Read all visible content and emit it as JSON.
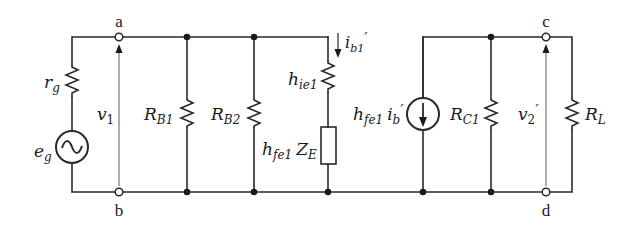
{
  "diagram": {
    "type": "small-signal equivalent circuit",
    "terminals": {
      "a": "a",
      "b": "b",
      "c": "c",
      "d": "d"
    },
    "source": {
      "resistor": {
        "sym": "r",
        "sub": "g"
      },
      "voltage": {
        "sym": "e",
        "sub": "g"
      }
    },
    "input_voltage": {
      "sym": "v",
      "sub": "1",
      "prime": ""
    },
    "components": {
      "rb1": {
        "sym": "R",
        "sub": "B1"
      },
      "rb2": {
        "sym": "R",
        "sub": "B2"
      },
      "hie1": {
        "sym": "h",
        "sub": "ie1"
      },
      "ze": {
        "sym1": "h",
        "sub1": "fe1",
        "sym2": "Z",
        "sub2": "E"
      },
      "current": {
        "sym": "i",
        "sub": "b1",
        "prime": "′"
      },
      "dependent_source": {
        "sym1": "h",
        "sub1": "fe1",
        "sym2": "i",
        "sub2": "b",
        "prime": "′"
      },
      "rc1": {
        "sym": "R",
        "sub": "C1"
      },
      "rl": {
        "sym": "R",
        "sub": "L"
      }
    },
    "output_voltage": {
      "sym": "v",
      "sub": "2",
      "prime": "′"
    }
  }
}
